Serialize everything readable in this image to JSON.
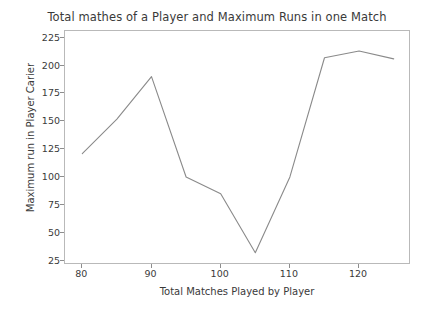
{
  "chart_data": {
    "type": "line",
    "title": "Total mathes of a Player and Maximum Runs in one Match",
    "xlabel": "Total Matches Played by Player",
    "ylabel": "Maximum run in Player Carier",
    "x": [
      80,
      85,
      90,
      95,
      100,
      105,
      110,
      115,
      120,
      125
    ],
    "values": [
      121,
      152,
      190,
      100,
      85,
      32,
      100,
      207,
      213,
      206
    ],
    "series": [
      {
        "name": "Maximum runs",
        "values": [
          121,
          152,
          190,
          100,
          85,
          32,
          100,
          207,
          213,
          206
        ]
      }
    ],
    "xlim": [
      77.5,
      127.5
    ],
    "ylim": [
      21,
      231
    ],
    "xticks": [
      80,
      90,
      100,
      110,
      120
    ],
    "xtick_labels": [
      "80",
      "90",
      "100",
      "110",
      "120"
    ],
    "yticks": [
      25,
      50,
      75,
      100,
      125,
      150,
      175,
      200,
      225
    ],
    "ytick_labels": [
      "225",
      "200",
      "175",
      "150",
      "125",
      "100",
      "75",
      "50",
      "25"
    ],
    "grid": false,
    "legend": false,
    "line_color": "#8a8a8a",
    "frame_color": "#b9b9b9",
    "background": "#ffffff"
  }
}
